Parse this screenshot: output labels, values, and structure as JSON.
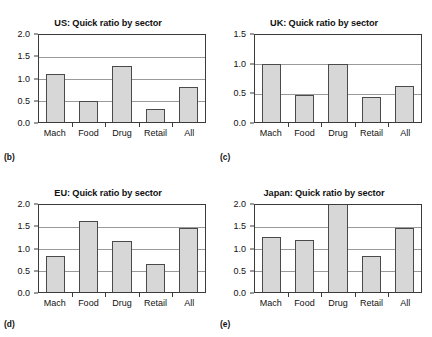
{
  "figure": {
    "categories": [
      "Mach",
      "Food",
      "Drug",
      "Retail",
      "All"
    ]
  },
  "panels": [
    {
      "tag": "(b)",
      "title": "US: Quick ratio by sector",
      "yticks": [
        "2.0",
        "1.5",
        "1.0",
        "0.5",
        "0.0"
      ]
    },
    {
      "tag": "(c)",
      "title": "UK: Quick ratio by sector",
      "yticks": [
        "1.5",
        "1.0",
        "0.5",
        "0.0"
      ]
    },
    {
      "tag": "(d)",
      "title": "EU: Quick ratio by sector",
      "yticks": [
        "2.0",
        "1.5",
        "1.0",
        "0.5",
        "0.0"
      ]
    },
    {
      "tag": "(e)",
      "title": "Japan: Quick ratio by sector",
      "yticks": [
        "2.0",
        "1.5",
        "1.0",
        "0.5",
        "0.0"
      ]
    }
  ],
  "chart_data": [
    {
      "type": "bar",
      "panel": "(b)",
      "title": "US: Quick ratio by sector",
      "categories": [
        "Mach",
        "Food",
        "Drug",
        "Retail",
        "All"
      ],
      "values": [
        1.09,
        0.47,
        1.27,
        0.29,
        0.79
      ],
      "xlabel": "",
      "ylabel": "",
      "ylim": [
        0.0,
        2.0
      ],
      "yticks": [
        0.0,
        0.5,
        1.0,
        1.5,
        2.0
      ],
      "grid": true,
      "legend": "none",
      "bar_fill": "#d7d7d7",
      "bar_edge": "#4a4a4a"
    },
    {
      "type": "bar",
      "panel": "(c)",
      "title": "UK: Quick ratio by sector",
      "categories": [
        "Mach",
        "Food",
        "Drug",
        "Retail",
        "All"
      ],
      "values": [
        0.97,
        0.45,
        0.97,
        0.43,
        0.6
      ],
      "xlabel": "",
      "ylabel": "",
      "ylim": [
        0.0,
        1.5
      ],
      "yticks": [
        0.0,
        0.5,
        1.0,
        1.5
      ],
      "grid": true,
      "legend": "none",
      "bar_fill": "#d7d7d7",
      "bar_edge": "#4a4a4a"
    },
    {
      "type": "bar",
      "panel": "(d)",
      "title": "EU: Quick ratio by sector",
      "categories": [
        "Mach",
        "Food",
        "Drug",
        "Retail",
        "All"
      ],
      "values": [
        0.82,
        1.6,
        1.15,
        0.63,
        1.43
      ],
      "xlabel": "",
      "ylabel": "",
      "ylim": [
        0.0,
        2.0
      ],
      "yticks": [
        0.0,
        0.5,
        1.0,
        1.5,
        2.0
      ],
      "grid": true,
      "legend": "none",
      "bar_fill": "#d7d7d7",
      "bar_edge": "#4a4a4a"
    },
    {
      "type": "bar",
      "panel": "(e)",
      "title": "Japan: Quick ratio by sector",
      "categories": [
        "Mach",
        "Food",
        "Drug",
        "Retail",
        "All"
      ],
      "values": [
        1.24,
        1.16,
        2.0,
        0.81,
        1.43
      ],
      "xlabel": "",
      "ylabel": "",
      "ylim": [
        0.0,
        2.0
      ],
      "yticks": [
        0.0,
        0.5,
        1.0,
        1.5,
        2.0
      ],
      "grid": true,
      "legend": "none",
      "bar_fill": "#d7d7d7",
      "bar_edge": "#4a4a4a"
    }
  ]
}
